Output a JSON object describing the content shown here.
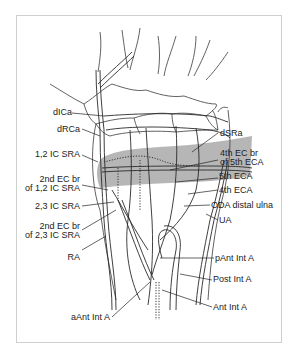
{
  "figure": {
    "band_color": "#a9a9a9",
    "line_color": "#333333",
    "labels_left": [
      {
        "id": "dICa",
        "text": "dICa"
      },
      {
        "id": "dRCa",
        "text": "dRCa"
      },
      {
        "id": "ic12sra",
        "text": "1,2 IC SRA"
      },
      {
        "id": "ec2_12",
        "line1": "2nd EC br",
        "line2": "of 1,2 IC SRA"
      },
      {
        "id": "ic23sra",
        "text": "2,3 IC SRA"
      },
      {
        "id": "ec2_23",
        "line1": "2nd EC br",
        "line2": "of 2,3 IC SRA"
      },
      {
        "id": "ra",
        "text": "RA"
      },
      {
        "id": "aantinta",
        "text": "aAnt Int A"
      }
    ],
    "labels_right": [
      {
        "id": "dsra",
        "text": "dSRa"
      },
      {
        "id": "ec4_5",
        "line1": "4th EC br",
        "line2": "of 5th ECA"
      },
      {
        "id": "eca5",
        "text": "5th ECA"
      },
      {
        "id": "eca4",
        "text": "4th ECA"
      },
      {
        "id": "oda",
        "text": "ODA distal ulna"
      },
      {
        "id": "ua",
        "text": "UA"
      },
      {
        "id": "pantinta",
        "text": "pAnt Int A"
      },
      {
        "id": "postinta",
        "text": "Post Int A"
      },
      {
        "id": "antinta",
        "text": "Ant Int A"
      }
    ]
  }
}
